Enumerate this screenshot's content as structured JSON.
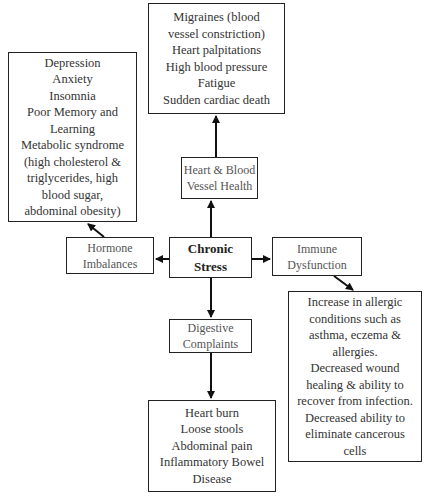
{
  "diagram": {
    "center": {
      "lines": [
        "Chronic",
        "Stress"
      ]
    },
    "categories": {
      "heart": {
        "lines": [
          "Heart & Blood",
          "Vessel Health"
        ]
      },
      "hormone": {
        "lines": [
          "Hormone",
          "Imbalances"
        ]
      },
      "immune": {
        "lines": [
          "Immune",
          "Dysfunction"
        ]
      },
      "digestive": {
        "lines": [
          "Digestive",
          "Complaints"
        ]
      }
    },
    "effects": {
      "heart": {
        "lines": [
          "Migraines (blood",
          "vessel constriction)",
          "Heart palpitations",
          "High blood pressure",
          "Fatigue",
          "Sudden cardiac death"
        ]
      },
      "hormone": {
        "lines": [
          "Depression",
          "Anxiety",
          "Insomnia",
          "Poor Memory and",
          "Learning",
          "Metabolic syndrome",
          "(high cholesterol &",
          "triglycerides, high",
          "blood sugar,",
          "abdominal obesity)"
        ]
      },
      "immune": {
        "lines": [
          "Increase in allergic",
          "conditions such as",
          "asthma, eczema &",
          "allergies.",
          "Decreased wound",
          "healing & ability to",
          "recover from infection.",
          "Decreased ability to",
          "eliminate cancerous",
          "cells"
        ]
      },
      "digestive": {
        "lines": [
          "Heart burn",
          "Loose stools",
          "Abdominal pain",
          "Inflammatory Bowel",
          "Disease"
        ]
      }
    }
  }
}
